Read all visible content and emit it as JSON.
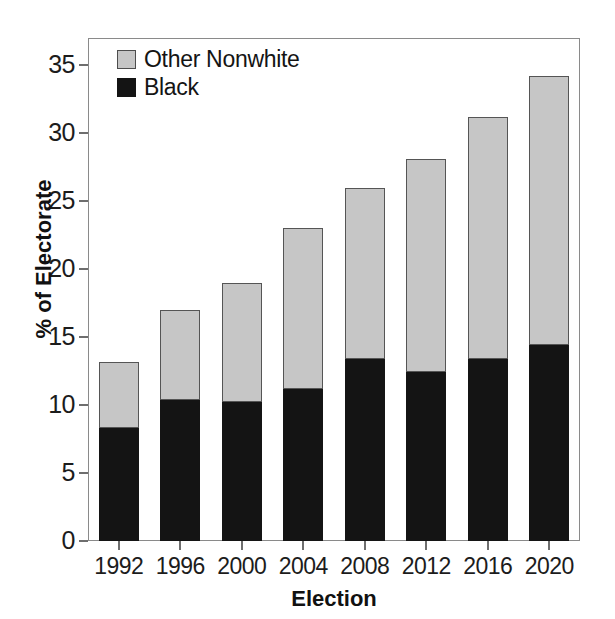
{
  "chart_data": {
    "type": "bar",
    "subtype": "stacked-vertical",
    "title": "",
    "xlabel": "Election",
    "ylabel": "% of Electorate",
    "categories": [
      "1992",
      "1996",
      "2000",
      "2004",
      "2008",
      "2012",
      "2016",
      "2020"
    ],
    "series": [
      {
        "name": "Black",
        "color": "#141414",
        "values": [
          8.3,
          10.4,
          10.2,
          11.2,
          13.4,
          12.4,
          13.4,
          14.4
        ]
      },
      {
        "name": "Other Nonwhite",
        "color": "#c6c6c6",
        "values": [
          4.9,
          6.6,
          8.8,
          11.8,
          12.6,
          15.7,
          17.8,
          19.8
        ]
      }
    ],
    "totals": [
      13.2,
      17.0,
      19.0,
      23.0,
      26.0,
      28.1,
      31.2,
      34.2
    ],
    "stack_order": [
      "Black",
      "Other Nonwhite"
    ],
    "ylim": [
      0,
      37
    ],
    "yticks": [
      0,
      5,
      10,
      15,
      20,
      25,
      30,
      35
    ],
    "ytick_labels": [
      "0",
      "5",
      "10",
      "15",
      "20",
      "25",
      "30",
      "35"
    ],
    "grid": false,
    "legend_position": "top-left",
    "legend": [
      {
        "label": "Other Nonwhite",
        "swatch": "gray"
      },
      {
        "label": "Black",
        "swatch": "black"
      }
    ]
  },
  "axes": {
    "y_title": "% of Electorate",
    "x_title": "Election"
  }
}
